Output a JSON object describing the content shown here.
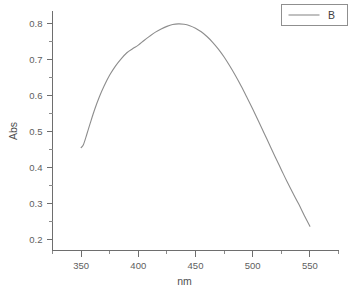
{
  "chart_data": {
    "type": "line",
    "title": "",
    "xlabel": "nm",
    "ylabel": "Abs",
    "xlim": [
      325,
      575
    ],
    "ylim": [
      0.17,
      0.835
    ],
    "grid": false,
    "legend_position": "top-right",
    "x_major_ticks": [
      350,
      400,
      450,
      500,
      550
    ],
    "x_tick_labels": [
      "350",
      "400",
      "450",
      "500",
      "550"
    ],
    "x_minor_ticks": [
      325,
      375,
      425,
      475,
      525,
      575
    ],
    "y_major_ticks": [
      0.2,
      0.3,
      0.4,
      0.5,
      0.6,
      0.7,
      0.8
    ],
    "y_tick_labels": [
      "0.2",
      "0.3",
      "0.4",
      "0.5",
      "0.6",
      "0.7",
      "0.8"
    ],
    "y_minor_ticks": [
      0.25,
      0.35,
      0.45,
      0.55,
      0.65,
      0.75
    ],
    "series": [
      {
        "name": "B",
        "color": "#8d8d8d",
        "x": [
          350,
          352,
          355,
          358,
          362,
          366,
          370,
          375,
          380,
          385,
          390,
          395,
          400,
          405,
          410,
          415,
          420,
          425,
          430,
          435,
          440,
          445,
          450,
          455,
          460,
          465,
          470,
          475,
          480,
          485,
          490,
          495,
          500,
          505,
          510,
          515,
          520,
          525,
          530,
          535,
          540,
          545,
          550
        ],
        "y": [
          0.455,
          0.463,
          0.492,
          0.523,
          0.562,
          0.596,
          0.625,
          0.656,
          0.681,
          0.701,
          0.718,
          0.729,
          0.739,
          0.752,
          0.764,
          0.775,
          0.784,
          0.791,
          0.796,
          0.798,
          0.797,
          0.793,
          0.786,
          0.776,
          0.763,
          0.747,
          0.728,
          0.706,
          0.681,
          0.654,
          0.625,
          0.594,
          0.562,
          0.529,
          0.495,
          0.461,
          0.427,
          0.394,
          0.361,
          0.33,
          0.3,
          0.268,
          0.237
        ]
      }
    ],
    "annotations": []
  },
  "legend": {
    "entries": [
      {
        "label": "B"
      }
    ]
  },
  "axes": {
    "x_title": "nm",
    "y_title": "Abs"
  }
}
